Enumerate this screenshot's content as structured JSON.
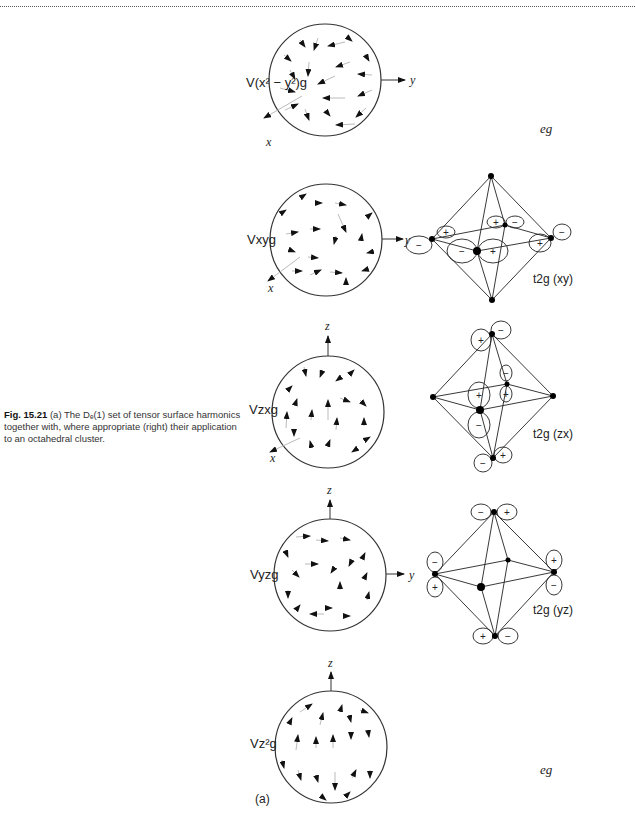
{
  "figure": {
    "caption_label": "Fig. 15.21",
    "caption_text": "(a) The Dₑ(1) set of tensor surface harmonics together with, where appropriate (right) their application to an octahedral cluster.",
    "panel_label": "(a)"
  },
  "rows": [
    {
      "harmonic": "V(x² − y²)g",
      "axes": [
        "y",
        "x"
      ],
      "right_label": "eg"
    },
    {
      "harmonic": "Vxyg",
      "axes": [
        "y",
        "x"
      ],
      "right_label": "t2g (xy)"
    },
    {
      "harmonic": "Vzxg",
      "axes": [
        "z",
        "x"
      ],
      "right_label": "t2g (zx)"
    },
    {
      "harmonic": "Vyzg",
      "axes": [
        "z",
        "y"
      ],
      "right_label": "t2g (yz)"
    },
    {
      "harmonic": "Vz²g",
      "axes": [
        "z"
      ],
      "right_label": "eg"
    }
  ],
  "signs": {
    "plus": "+",
    "minus": "−"
  }
}
